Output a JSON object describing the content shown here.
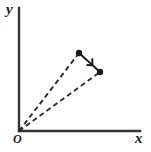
{
  "figure": {
    "kind": "vector-displacement-diagram",
    "background_color": "#ffffff",
    "stroke_color": "#333333",
    "marker_color": "#1a1a1a",
    "labels": {
      "y_axis": "y",
      "x_axis": "x",
      "origin": "O"
    },
    "axes": {
      "origin_point": [
        19,
        131
      ],
      "y_axis_top": [
        19,
        8
      ],
      "x_axis_right": [
        140,
        131
      ],
      "line_width": 2.4
    },
    "points": [
      {
        "name": "point-1",
        "x": 79,
        "y": 53,
        "radius": 3.2
      },
      {
        "name": "point-2",
        "x": 100,
        "y": 72,
        "radius": 3.2
      }
    ],
    "dashed_vectors": [
      {
        "name": "position-vector-1",
        "from": [
          19,
          131
        ],
        "to": [
          79,
          53
        ],
        "dash": "5,3.5"
      },
      {
        "name": "position-vector-2",
        "from": [
          19,
          131
        ],
        "to": [
          100,
          72
        ],
        "dash": "5,3.5"
      }
    ],
    "displacement_vector": {
      "name": "displacement-vector",
      "from": [
        79,
        53
      ],
      "to": [
        100,
        72
      ],
      "arrow_tip": [
        92,
        65
      ],
      "arrow_size": 7.5
    }
  }
}
